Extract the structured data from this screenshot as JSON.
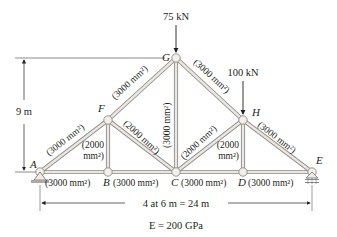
{
  "diagram": {
    "type": "truss",
    "nodes": {
      "A": {
        "label": "A"
      },
      "B": {
        "label": "B"
      },
      "C": {
        "label": "C"
      },
      "D": {
        "label": "D"
      },
      "E": {
        "label": "E"
      },
      "F": {
        "label": "F"
      },
      "G": {
        "label": "G"
      },
      "H": {
        "label": "H"
      }
    },
    "members": [
      {
        "id": "AB",
        "from": "A",
        "to": "B",
        "area": "(3000 mm²)"
      },
      {
        "id": "BC",
        "from": "B",
        "to": "C",
        "area": "(3000 mm²)"
      },
      {
        "id": "CD",
        "from": "C",
        "to": "D",
        "area": "(3000 mm²)"
      },
      {
        "id": "DE",
        "from": "D",
        "to": "E",
        "area": "(3000 mm²)"
      },
      {
        "id": "AF",
        "from": "A",
        "to": "F",
        "area": "(3000 mm²)"
      },
      {
        "id": "FG",
        "from": "F",
        "to": "G",
        "area": "(3000 mm²)"
      },
      {
        "id": "GH",
        "from": "G",
        "to": "H",
        "area": "(3000 mm²)"
      },
      {
        "id": "HE",
        "from": "H",
        "to": "E",
        "area": "(3000 mm²)"
      },
      {
        "id": "BF",
        "from": "B",
        "to": "F",
        "area_line1": "(2000",
        "area_line2": "mm²)"
      },
      {
        "id": "FC",
        "from": "F",
        "to": "C",
        "area": "(2000 mm²)"
      },
      {
        "id": "CG",
        "from": "C",
        "to": "G",
        "area": "(3000 mm²)"
      },
      {
        "id": "CH",
        "from": "C",
        "to": "H",
        "area": "(2000 mm²)"
      },
      {
        "id": "DH",
        "from": "D",
        "to": "H",
        "area_line1": "(2000",
        "area_line2": "mm²)"
      }
    ],
    "loads": [
      {
        "node": "G",
        "label": "75 kN"
      },
      {
        "node": "H",
        "label": "100 kN"
      }
    ],
    "dimensions": {
      "height": "9 m",
      "span": "4 at 6 m = 24 m"
    },
    "modulus": "E = 200 GPa"
  }
}
